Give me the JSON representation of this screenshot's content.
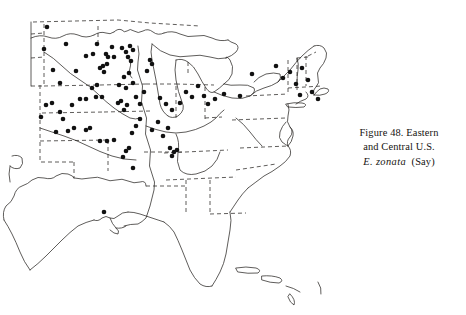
{
  "figure": {
    "caption_line1": "Figure 48. Eastern",
    "caption_line2": "and Central U.S.",
    "caption_species": "E. zonata",
    "caption_authority": "(Say)"
  },
  "map": {
    "title": "Eastern and Central U.S. distribution map",
    "colors": {
      "background": "#ffffff",
      "coastline": "#2a2724",
      "state_border": "#2a2724",
      "dot_fill": "#111111"
    },
    "style": {
      "coastline_width": 0.75,
      "border_width": 0.75,
      "border_dash": "4,3",
      "dot_radius": 2.3
    }
  },
  "chart_data": {
    "type": "scatter",
    "xlabel": "",
    "ylabel": "",
    "grid": false,
    "legend": "none",
    "xlim": [
      0,
      466
    ],
    "ylim": [
      0,
      315
    ],
    "note": "Occurrence dots: pixel coordinates of each collection locality record plotted on the base map",
    "point_count": 92,
    "points": [
      [
        47,
        27
      ],
      [
        44,
        49
      ],
      [
        66,
        44
      ],
      [
        86,
        56
      ],
      [
        53,
        70
      ],
      [
        76,
        71
      ],
      [
        60,
        83
      ],
      [
        93,
        54
      ],
      [
        97,
        44
      ],
      [
        106,
        54
      ],
      [
        108,
        57
      ],
      [
        112,
        47
      ],
      [
        114,
        57
      ],
      [
        97,
        85
      ],
      [
        92,
        88
      ],
      [
        96,
        97
      ],
      [
        102,
        97
      ],
      [
        86,
        99
      ],
      [
        80,
        99
      ],
      [
        100,
        68
      ],
      [
        103,
        66
      ],
      [
        107,
        64
      ],
      [
        104,
        72
      ],
      [
        122,
        48
      ],
      [
        126,
        52
      ],
      [
        130,
        46
      ],
      [
        133,
        50
      ],
      [
        128,
        57
      ],
      [
        131,
        61
      ],
      [
        129,
        73
      ],
      [
        124,
        77
      ],
      [
        119,
        85
      ],
      [
        126,
        88
      ],
      [
        133,
        83
      ],
      [
        118,
        103
      ],
      [
        121,
        101
      ],
      [
        127,
        105
      ],
      [
        124,
        110
      ],
      [
        136,
        97
      ],
      [
        140,
        104
      ],
      [
        144,
        92
      ],
      [
        150,
        60
      ],
      [
        152,
        64
      ],
      [
        147,
        71
      ],
      [
        140,
        119
      ],
      [
        136,
        126
      ],
      [
        132,
        133
      ],
      [
        46,
        105
      ],
      [
        52,
        103
      ],
      [
        41,
        117
      ],
      [
        60,
        112
      ],
      [
        63,
        119
      ],
      [
        72,
        105
      ],
      [
        68,
        131
      ],
      [
        56,
        132
      ],
      [
        74,
        128
      ],
      [
        86,
        130
      ],
      [
        90,
        128
      ],
      [
        100,
        141
      ],
      [
        107,
        141
      ],
      [
        114,
        140
      ],
      [
        126,
        151
      ],
      [
        129,
        148
      ],
      [
        123,
        157
      ],
      [
        104,
        212
      ],
      [
        133,
        168
      ],
      [
        152,
        130
      ],
      [
        158,
        122
      ],
      [
        163,
        136
      ],
      [
        168,
        128
      ],
      [
        170,
        148
      ],
      [
        174,
        152
      ],
      [
        177,
        150
      ],
      [
        172,
        156
      ],
      [
        160,
        98
      ],
      [
        166,
        104
      ],
      [
        172,
        110
      ],
      [
        180,
        103
      ],
      [
        186,
        92
      ],
      [
        192,
        97
      ],
      [
        198,
        86
      ],
      [
        204,
        96
      ],
      [
        208,
        104
      ],
      [
        215,
        99
      ],
      [
        224,
        94
      ],
      [
        240,
        96
      ],
      [
        252,
        74
      ],
      [
        276,
        66
      ],
      [
        283,
        78
      ],
      [
        290,
        72
      ],
      [
        296,
        84
      ],
      [
        302,
        68
      ],
      [
        308,
        80
      ],
      [
        300,
        95
      ],
      [
        312,
        92
      ],
      [
        318,
        99
      ]
    ]
  }
}
